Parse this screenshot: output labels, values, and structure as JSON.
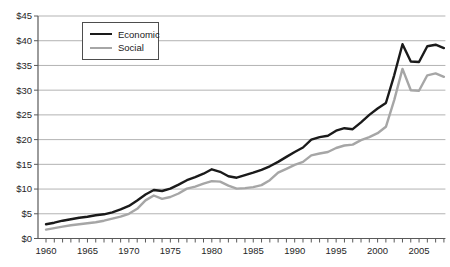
{
  "chart": {
    "colors": {
      "economic_line": "#1a1a1a",
      "social_line": "#a6a6a6",
      "gridline": "#b3b3b3",
      "axis": "#595959",
      "tick": "#595959",
      "label_text": "#262626",
      "background": "#ffffff",
      "legend_border": "#4d4d4d"
    },
    "legend": {
      "entries": [
        {
          "label": "Economic",
          "swatch": "economic_line",
          "thickness": 3
        },
        {
          "label": "Social",
          "swatch": "social_line",
          "thickness": 3
        }
      ]
    }
  },
  "chart_data": {
    "type": "line",
    "title": "",
    "xlabel": "",
    "ylabel": "",
    "grid": "horizontal",
    "legend_position": "top-left-inside",
    "xlim": [
      1960,
      2008
    ],
    "ylim": [
      0,
      45
    ],
    "y_tick_step": 5,
    "y_tick_labels": [
      "$0",
      "$5",
      "$10",
      "$15",
      "$20",
      "$25",
      "$30",
      "$35",
      "$40",
      "$45"
    ],
    "x_tick_labels": [
      "1960",
      "1965",
      "1970",
      "1975",
      "1980",
      "1985",
      "1990",
      "1995",
      "2000",
      "2005"
    ],
    "x_labeled_years": [
      1960,
      1965,
      1970,
      1975,
      1980,
      1985,
      1990,
      1995,
      2000,
      2005
    ],
    "x": [
      1960,
      1961,
      1962,
      1963,
      1964,
      1965,
      1966,
      1967,
      1968,
      1969,
      1970,
      1971,
      1972,
      1973,
      1974,
      1975,
      1976,
      1977,
      1978,
      1979,
      1980,
      1981,
      1982,
      1983,
      1984,
      1985,
      1986,
      1987,
      1988,
      1989,
      1990,
      1991,
      1992,
      1993,
      1994,
      1995,
      1996,
      1997,
      1998,
      1999,
      2000,
      2001,
      2002,
      2003,
      2004,
      2005,
      2006,
      2007,
      2008
    ],
    "series": [
      {
        "name": "Economic",
        "color_key": "economic_line",
        "values": [
          2.9,
          3.2,
          3.6,
          3.9,
          4.2,
          4.4,
          4.7,
          4.9,
          5.3,
          5.9,
          6.6,
          7.7,
          8.9,
          9.8,
          9.6,
          10.1,
          10.9,
          11.8,
          12.4,
          13.1,
          14.0,
          13.5,
          12.6,
          12.3,
          12.8,
          13.3,
          13.9,
          14.6,
          15.5,
          16.5,
          17.5,
          18.4,
          20.0,
          20.5,
          20.8,
          21.8,
          22.3,
          22.1,
          23.5,
          25.0,
          26.3,
          27.4,
          33.0,
          39.3,
          35.8,
          35.7,
          38.9,
          39.2,
          38.5
        ]
      },
      {
        "name": "Social",
        "color_key": "social_line",
        "values": [
          1.8,
          2.1,
          2.4,
          2.7,
          2.9,
          3.1,
          3.3,
          3.6,
          4.0,
          4.4,
          5.0,
          6.0,
          7.7,
          8.7,
          8.0,
          8.4,
          9.1,
          10.1,
          10.5,
          11.1,
          11.6,
          11.5,
          10.7,
          10.1,
          10.2,
          10.4,
          10.8,
          11.8,
          13.3,
          14.1,
          14.9,
          15.5,
          16.8,
          17.2,
          17.5,
          18.3,
          18.8,
          19.0,
          19.9,
          20.5,
          21.3,
          22.6,
          28.0,
          34.3,
          30.0,
          29.9,
          33.0,
          33.4,
          32.7
        ]
      }
    ]
  }
}
